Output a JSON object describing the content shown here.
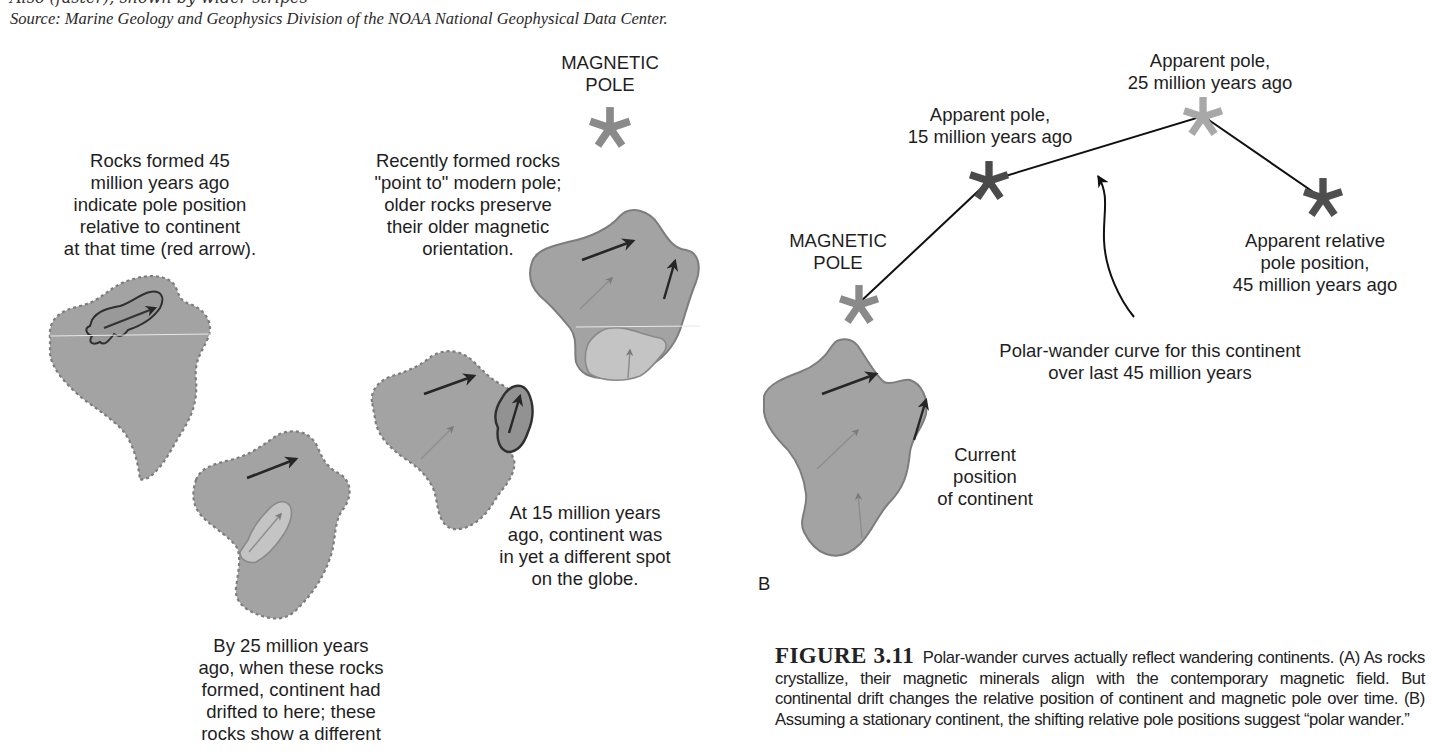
{
  "header": {
    "cut_line": "Also (faster), shown by wider stripes",
    "source": "Source: Marine Geology and Geophysics Division of the NOAA National Geophysical Data Center."
  },
  "panel_a": {
    "magnetic_pole_label": "MAGNETIC\nPOLE",
    "label_45": "Rocks formed 45\nmillion years ago\nindicate pole position\nrelative to continent\nat that time (red arrow).",
    "label_recent": "Recently formed rocks\n\"point to\" modern pole;\nolder rocks preserve\ntheir older magnetic\norientation.",
    "label_15": "At 15 million years\nago, continent was\nin yet a different spot\non the globe.",
    "label_25": "By 25 million years\nago, when these rocks\nformed, continent had\ndrifted to here; these\nrocks show a different"
  },
  "panel_b": {
    "panel_letter": "B",
    "magnetic_pole_label": "MAGNETIC\nPOLE",
    "pole_15_label": "Apparent pole,\n15 million years ago",
    "pole_25_label": "Apparent pole,\n25 million years ago",
    "pole_45_label": "Apparent relative\npole position,\n45 million years ago",
    "curve_label": "Polar-wander curve for this continent\nover last 45 million years",
    "continent_label": "Current\nposition\nof continent"
  },
  "caption": {
    "figure_number": "FIGURE 3.11",
    "text": "Polar-wander curves actually reflect wandering continents. (A) As rocks crystallize, their magnetic minerals align with the contemporary magnetic field. But continental drift changes the relative position of continent and magnetic pole over time. (B) Assuming a stationary continent, the shifting relative pole positions suggest “polar wander.”"
  },
  "colors": {
    "continent_fill": "#a3a3a3",
    "continent_edge": "#7d7d7d",
    "star_modern": "#8a8a8a",
    "star_15": "#4a4a4a",
    "star_25": "#a8a8a8",
    "star_45": "#4f4f4f",
    "rock_light": "#c4c4c4",
    "rock_dark_outline": "#3a3a3a"
  }
}
